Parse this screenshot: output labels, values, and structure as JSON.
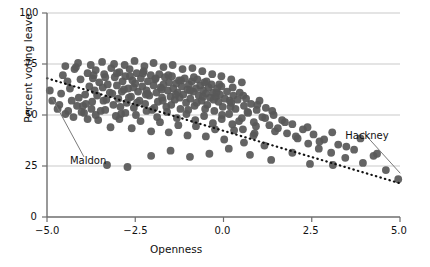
{
  "chart_data": {
    "type": "scatter",
    "title": "",
    "xlabel": "Openness",
    "ylabel": "Percent voting leave",
    "xlim": [
      -5.0,
      5.0
    ],
    "ylim": [
      0,
      100
    ],
    "xticks": [
      "-5.0",
      "-2.5",
      "0.0",
      "2.5",
      "5.0"
    ],
    "xtick_values": [
      -5.0,
      -2.5,
      0.0,
      2.5,
      5.0
    ],
    "yticks": [
      "0",
      "25",
      "50",
      "75",
      "100"
    ],
    "ytick_values": [
      0,
      25,
      50,
      75,
      100
    ],
    "grid": "horizontal",
    "legend": "none",
    "marker_color": "#585858",
    "trendline": {
      "style": "dotted",
      "color": "#111111",
      "x_start": -5.0,
      "y_start": 68.0,
      "x_end": 5.0,
      "y_end": 16.5
    },
    "annotations": [
      {
        "label": "Maldon",
        "label_x": -4.35,
        "label_y": 27.0,
        "point_x": -4.92,
        "point_y": 62.0
      },
      {
        "label": "Hackney",
        "label_x": 3.45,
        "label_y": 39.0,
        "point_x": 4.95,
        "point_y": 18.5
      }
    ],
    "points": [
      [
        -4.92,
        62.0
      ],
      [
        -4.55,
        69.5
      ],
      [
        -4.42,
        66.5
      ],
      [
        -4.3,
        57.0
      ],
      [
        -4.22,
        72.5
      ],
      [
        -4.18,
        73.5
      ],
      [
        -4.05,
        67.5
      ],
      [
        -3.98,
        54.5
      ],
      [
        -3.92,
        60.0
      ],
      [
        -3.85,
        70.5
      ],
      [
        -3.8,
        64.0
      ],
      [
        -3.74,
        53.0
      ],
      [
        -3.7,
        68.0
      ],
      [
        -3.62,
        72.0
      ],
      [
        -3.58,
        59.5
      ],
      [
        -3.52,
        66.0
      ],
      [
        -3.48,
        52.0
      ],
      [
        -3.42,
        63.5
      ],
      [
        -3.38,
        70.0
      ],
      [
        -3.32,
        57.5
      ],
      [
        -3.28,
        65.0
      ],
      [
        -3.22,
        61.0
      ],
      [
        -3.18,
        73.0
      ],
      [
        -3.12,
        55.0
      ],
      [
        -3.08,
        68.5
      ],
      [
        -3.02,
        64.5
      ],
      [
        -2.98,
        58.0
      ],
      [
        -2.95,
        71.0
      ],
      [
        -2.9,
        50.5
      ],
      [
        -2.86,
        66.5
      ],
      [
        -2.82,
        62.5
      ],
      [
        -2.78,
        69.0
      ],
      [
        -2.74,
        56.0
      ],
      [
        -2.7,
        63.0
      ],
      [
        -2.66,
        72.5
      ],
      [
        -2.62,
        59.0
      ],
      [
        -2.58,
        67.0
      ],
      [
        -2.54,
        53.5
      ],
      [
        -2.5,
        65.5
      ],
      [
        -2.46,
        70.5
      ],
      [
        -2.42,
        61.5
      ],
      [
        -2.38,
        57.0
      ],
      [
        -2.34,
        68.0
      ],
      [
        -2.3,
        64.0
      ],
      [
        -2.26,
        71.5
      ],
      [
        -2.22,
        55.5
      ],
      [
        -2.18,
        62.0
      ],
      [
        -2.14,
        66.5
      ],
      [
        -2.1,
        59.5
      ],
      [
        -2.06,
        69.5
      ],
      [
        -2.02,
        52.5
      ],
      [
        -1.98,
        64.5
      ],
      [
        -1.94,
        67.5
      ],
      [
        -1.9,
        61.0
      ],
      [
        -1.86,
        56.5
      ],
      [
        -1.82,
        70.0
      ],
      [
        -1.78,
        63.5
      ],
      [
        -1.74,
        58.5
      ],
      [
        -1.7,
        65.0
      ],
      [
        -1.66,
        68.5
      ],
      [
        -1.62,
        54.0
      ],
      [
        -1.58,
        62.0
      ],
      [
        -1.54,
        66.0
      ],
      [
        -1.5,
        59.0
      ],
      [
        -1.46,
        69.0
      ],
      [
        -1.42,
        63.0
      ],
      [
        -1.38,
        57.5
      ],
      [
        -1.34,
        65.5
      ],
      [
        -1.3,
        61.0
      ],
      [
        -1.26,
        67.0
      ],
      [
        -1.22,
        53.0
      ],
      [
        -1.18,
        64.0
      ],
      [
        -1.14,
        60.0
      ],
      [
        -1.1,
        68.0
      ],
      [
        -1.06,
        56.0
      ],
      [
        -1.02,
        62.5
      ],
      [
        -0.98,
        65.0
      ],
      [
        -0.94,
        58.0
      ],
      [
        -0.9,
        66.5
      ],
      [
        -0.86,
        61.5
      ],
      [
        -0.82,
        54.5
      ],
      [
        -0.78,
        63.0
      ],
      [
        -0.74,
        67.5
      ],
      [
        -0.7,
        59.5
      ],
      [
        -0.66,
        64.5
      ],
      [
        -0.62,
        57.0
      ],
      [
        -0.58,
        62.0
      ],
      [
        -0.54,
        66.0
      ],
      [
        -0.5,
        60.5
      ],
      [
        -0.46,
        55.0
      ],
      [
        -0.42,
        63.5
      ],
      [
        -0.38,
        58.5
      ],
      [
        -0.34,
        65.0
      ],
      [
        -0.3,
        61.0
      ],
      [
        -0.26,
        52.0
      ],
      [
        -0.22,
        59.0
      ],
      [
        -0.18,
        63.0
      ],
      [
        -0.14,
        56.5
      ],
      [
        -0.1,
        60.0
      ],
      [
        -0.06,
        64.0
      ],
      [
        -0.02,
        54.0
      ],
      [
        0.04,
        58.0
      ],
      [
        0.1,
        61.5
      ],
      [
        0.16,
        50.5
      ],
      [
        0.22,
        56.0
      ],
      [
        0.28,
        59.5
      ],
      [
        0.34,
        53.0
      ],
      [
        0.4,
        57.5
      ],
      [
        0.46,
        61.0
      ],
      [
        0.52,
        48.5
      ],
      [
        0.58,
        54.5
      ],
      [
        0.64,
        58.0
      ],
      [
        0.7,
        51.0
      ],
      [
        0.78,
        55.5
      ],
      [
        0.86,
        46.5
      ],
      [
        0.94,
        52.5
      ],
      [
        1.02,
        57.0
      ],
      [
        1.1,
        49.0
      ],
      [
        1.2,
        53.5
      ],
      [
        1.3,
        45.0
      ],
      [
        1.42,
        50.0
      ],
      [
        1.54,
        43.5
      ],
      [
        1.66,
        47.5
      ],
      [
        1.8,
        41.0
      ],
      [
        1.95,
        45.5
      ],
      [
        2.1,
        38.5
      ],
      [
        2.25,
        43.0
      ],
      [
        2.4,
        36.0
      ],
      [
        2.55,
        40.5
      ],
      [
        2.7,
        33.5
      ],
      [
        2.85,
        38.0
      ],
      [
        3.05,
        31.5
      ],
      [
        3.25,
        35.5
      ],
      [
        3.45,
        29.0
      ],
      [
        3.7,
        33.0
      ],
      [
        3.95,
        26.5
      ],
      [
        4.25,
        30.0
      ],
      [
        4.6,
        23.0
      ],
      [
        4.95,
        18.5
      ],
      [
        -4.6,
        60.5
      ],
      [
        -4.35,
        63.0
      ],
      [
        -4.1,
        58.5
      ],
      [
        -3.9,
        55.5
      ],
      [
        -3.65,
        62.0
      ],
      [
        -3.4,
        57.0
      ],
      [
        -3.15,
        60.5
      ],
      [
        -2.92,
        54.0
      ],
      [
        -2.68,
        58.5
      ],
      [
        -2.45,
        56.0
      ],
      [
        -2.2,
        60.0
      ],
      [
        -1.96,
        53.5
      ],
      [
        -1.72,
        57.0
      ],
      [
        -1.48,
        55.0
      ],
      [
        -1.24,
        58.5
      ],
      [
        -1.0,
        52.5
      ],
      [
        -0.76,
        56.0
      ],
      [
        -0.52,
        53.0
      ],
      [
        -0.28,
        57.5
      ],
      [
        -0.04,
        50.0
      ],
      [
        0.2,
        54.0
      ],
      [
        0.44,
        47.0
      ],
      [
        0.68,
        51.5
      ],
      [
        0.92,
        44.5
      ],
      [
        1.18,
        48.5
      ],
      [
        1.46,
        42.0
      ],
      [
        1.74,
        46.5
      ],
      [
        2.05,
        39.5
      ],
      [
        2.38,
        44.0
      ],
      [
        2.72,
        37.0
      ],
      [
        3.08,
        41.5
      ],
      [
        3.48,
        34.5
      ],
      [
        3.88,
        38.5
      ],
      [
        4.35,
        31.0
      ],
      [
        -4.48,
        74.0
      ],
      [
        -4.12,
        75.5
      ],
      [
        -3.76,
        74.5
      ],
      [
        -3.44,
        76.0
      ],
      [
        -3.1,
        75.0
      ],
      [
        -2.8,
        74.5
      ],
      [
        -2.52,
        76.5
      ],
      [
        -2.24,
        74.0
      ],
      [
        -1.98,
        75.5
      ],
      [
        -1.7,
        73.5
      ],
      [
        -1.44,
        74.5
      ],
      [
        -1.16,
        72.5
      ],
      [
        -0.88,
        73.0
      ],
      [
        -0.6,
        71.5
      ],
      [
        -0.32,
        70.0
      ],
      [
        -0.06,
        69.0
      ],
      [
        0.22,
        67.5
      ],
      [
        0.52,
        66.0
      ],
      [
        -3.55,
        47.5
      ],
      [
        -3.2,
        44.0
      ],
      [
        -2.95,
        48.0
      ],
      [
        -2.6,
        43.5
      ],
      [
        -2.35,
        47.0
      ],
      [
        -2.05,
        42.0
      ],
      [
        -1.8,
        46.5
      ],
      [
        -1.55,
        41.5
      ],
      [
        -1.28,
        45.0
      ],
      [
        -1.02,
        40.0
      ],
      [
        -0.78,
        44.5
      ],
      [
        -0.5,
        39.5
      ],
      [
        -0.24,
        43.0
      ],
      [
        0.02,
        38.0
      ],
      [
        0.3,
        42.5
      ],
      [
        0.58,
        36.5
      ],
      [
        0.88,
        41.0
      ],
      [
        1.16,
        35.0
      ],
      [
        -3.3,
        25.5
      ],
      [
        -2.72,
        24.5
      ],
      [
        -2.05,
        30.0
      ],
      [
        -1.5,
        32.5
      ],
      [
        -0.95,
        29.5
      ],
      [
        -0.4,
        31.0
      ],
      [
        0.15,
        33.5
      ],
      [
        0.75,
        30.5
      ],
      [
        1.35,
        28.0
      ],
      [
        1.95,
        31.5
      ],
      [
        2.45,
        26.0
      ],
      [
        3.1,
        25.5
      ],
      [
        -4.7,
        53.0
      ],
      [
        -4.48,
        50.5
      ],
      [
        -4.25,
        49.0
      ],
      [
        -4.02,
        51.5
      ],
      [
        -3.85,
        48.0
      ],
      [
        -3.62,
        50.0
      ],
      [
        -3.35,
        52.5
      ],
      [
        -3.05,
        49.5
      ],
      [
        -2.78,
        51.0
      ],
      [
        -2.48,
        50.0
      ],
      [
        -2.18,
        52.0
      ],
      [
        -1.88,
        49.0
      ],
      [
        -1.6,
        51.5
      ],
      [
        -1.32,
        48.5
      ],
      [
        -1.05,
        50.5
      ],
      [
        -0.8,
        47.5
      ],
      [
        -0.55,
        49.5
      ],
      [
        -0.3,
        46.0
      ],
      [
        -0.05,
        48.0
      ],
      [
        0.25,
        45.5
      ],
      [
        0.55,
        43.0
      ],
      [
        0.85,
        40.0
      ],
      [
        -3.68,
        69.5
      ],
      [
        -3.35,
        68.5
      ],
      [
        -3.02,
        70.5
      ],
      [
        -2.65,
        69.0
      ],
      [
        -2.28,
        70.5
      ],
      [
        -1.92,
        68.0
      ],
      [
        -1.56,
        69.5
      ],
      [
        -1.2,
        67.0
      ],
      [
        -0.84,
        68.5
      ],
      [
        -0.48,
        66.5
      ],
      [
        -0.12,
        65.0
      ],
      [
        0.26,
        63.5
      ],
      [
        -2.88,
        61.5
      ],
      [
        -2.55,
        63.5
      ],
      [
        -2.15,
        60.5
      ],
      [
        -1.75,
        62.5
      ],
      [
        -1.35,
        60.0
      ],
      [
        -0.95,
        62.0
      ],
      [
        -0.58,
        59.0
      ],
      [
        -0.2,
        61.0
      ],
      [
        0.18,
        57.0
      ],
      [
        0.56,
        59.5
      ],
      [
        0.96,
        55.0
      ],
      [
        1.38,
        52.0
      ],
      [
        -4.85,
        57.0
      ],
      [
        -4.65,
        55.0
      ],
      [
        -4.4,
        52.0
      ],
      [
        -4.15,
        54.5
      ],
      [
        -3.95,
        51.0
      ],
      [
        -3.72,
        56.5
      ]
    ]
  },
  "axis": {
    "ytick_labels": [
      "100",
      "75",
      "50",
      "25",
      "0"
    ],
    "xtick_labels": [
      "-5.0",
      "-2.5",
      "0.0",
      "2.5",
      "5.0"
    ],
    "y_axis_title": "Percent voting leave",
    "x_axis_title": "Openness"
  }
}
